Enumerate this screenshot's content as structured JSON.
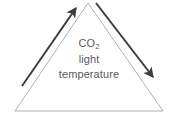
{
  "diagram": {
    "background_color": "#ffffff",
    "triangle": {
      "name": "triangle-outline",
      "stroke_color": "#b0b0b0",
      "stroke_width": 1,
      "fill": "none",
      "apex": {
        "x": 88,
        "y": 3
      },
      "bottom_left": {
        "x": 15,
        "y": 111
      },
      "bottom_right": {
        "x": 163,
        "y": 111
      }
    },
    "labels": {
      "line1_text": "CO",
      "line1_subscript": "2",
      "line2": "light",
      "line3": "temperature",
      "text_color": "#5a5a5a"
    },
    "arrows": [
      {
        "name": "left-arrow-up",
        "direction": "up-right",
        "color": "#3d3d3d",
        "stroke_width": 2,
        "tail": {
          "x": 22,
          "y": 86
        },
        "tip": {
          "x": 79,
          "y": 4
        }
      },
      {
        "name": "right-arrow-down",
        "direction": "down-right",
        "color": "#3d3d3d",
        "stroke_width": 2,
        "tail": {
          "x": 96,
          "y": 3
        },
        "tip": {
          "x": 157,
          "y": 83
        }
      }
    ]
  }
}
